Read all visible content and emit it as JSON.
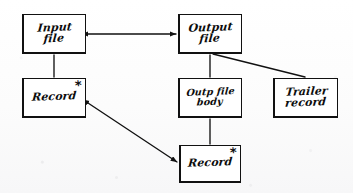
{
  "diagram": {
    "medium": "hand-drawn sketch on paper",
    "stroke_color": "#111111",
    "background_color": "#fdfdfd",
    "nodes": [
      {
        "id": "input-file",
        "label": "Input\nfile",
        "x": 22,
        "y": 14,
        "w": 64,
        "h": 40,
        "repeating_marker": "",
        "size": "normal"
      },
      {
        "id": "output-file",
        "label": "Output\nfile",
        "x": 178,
        "y": 14,
        "w": 64,
        "h": 40,
        "repeating_marker": "",
        "size": "normal"
      },
      {
        "id": "input-record",
        "label": "Record",
        "x": 22,
        "y": 78,
        "w": 64,
        "h": 40,
        "repeating_marker": "*",
        "size": "normal"
      },
      {
        "id": "output-file-body",
        "label": "Outp file\nbody",
        "x": 178,
        "y": 78,
        "w": 64,
        "h": 40,
        "repeating_marker": "",
        "size": "small"
      },
      {
        "id": "trailer-record",
        "label": "Trailer\nrecord",
        "x": 273,
        "y": 78,
        "w": 65,
        "h": 40,
        "repeating_marker": "",
        "size": "normal"
      },
      {
        "id": "output-record",
        "label": "Record",
        "x": 179,
        "y": 145,
        "w": 62,
        "h": 38,
        "repeating_marker": "*",
        "size": "normal"
      }
    ],
    "edges": [
      {
        "id": "input-file-to-output-file",
        "from": "input-file",
        "to": "output-file",
        "kind": "double-arrow",
        "x1": 88,
        "y1": 34,
        "x2": 176,
        "y2": 34
      },
      {
        "id": "input-file-to-input-record",
        "from": "input-file",
        "to": "input-record",
        "kind": "line",
        "x1": 54,
        "y1": 55,
        "x2": 54,
        "y2": 77
      },
      {
        "id": "output-file-to-output-file-body",
        "from": "output-file",
        "to": "output-file-body",
        "kind": "line",
        "x1": 210,
        "y1": 55,
        "x2": 210,
        "y2": 77
      },
      {
        "id": "output-file-to-trailer-record",
        "from": "output-file",
        "to": "trailer-record",
        "kind": "line",
        "x1": 213,
        "y1": 54,
        "x2": 305,
        "y2": 77
      },
      {
        "id": "output-file-body-to-output-record",
        "from": "output-file-body",
        "to": "output-record",
        "kind": "line",
        "x1": 210,
        "y1": 119,
        "x2": 210,
        "y2": 144
      },
      {
        "id": "input-record-to-output-record",
        "from": "input-record",
        "to": "output-record",
        "kind": "double-arrow",
        "x1": 88,
        "y1": 103,
        "x2": 177,
        "y2": 162
      }
    ]
  }
}
